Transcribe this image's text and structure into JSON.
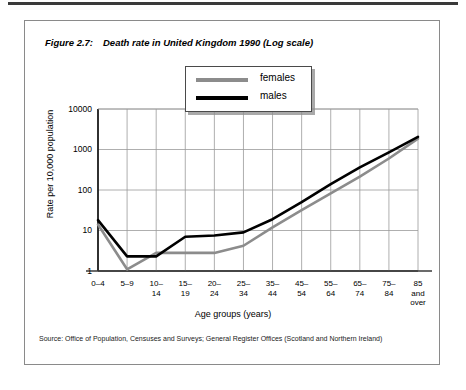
{
  "figure": {
    "number": "Figure 2.7:",
    "title": "Death rate in United Kingdom 1990 (Log scale)",
    "source": "Source: Office of Population, Censuses and Surveys; General Register Offices (Scotland and Northern Ireland)"
  },
  "legend": {
    "items": [
      {
        "label": "females",
        "color": "#8c8c8c"
      },
      {
        "label": "males",
        "color": "#000000"
      }
    ]
  },
  "chart_data": {
    "type": "line",
    "title": "Death rate in United Kingdom 1990 (Log scale)",
    "xlabel": "Age groups (years)",
    "ylabel": "Rate per 10,000  population",
    "yscale": "log",
    "ylim": [
      1,
      10000
    ],
    "yticks": [
      "1",
      "10",
      "100",
      "1000",
      "10000"
    ],
    "grid": true,
    "legend_position": "top-center",
    "categories": [
      "0–4",
      "5–9",
      "10–14",
      "15–19",
      "20–24",
      "25–34",
      "35–44",
      "45–54",
      "55–64",
      "65–74",
      "75–84",
      "85 and over"
    ],
    "categories_display": [
      [
        "0–4"
      ],
      [
        "5–9"
      ],
      [
        "10–",
        "14"
      ],
      [
        "15–",
        "19"
      ],
      [
        "20–",
        "24"
      ],
      [
        "25–",
        "34"
      ],
      [
        "35–",
        "44"
      ],
      [
        "45–",
        "54"
      ],
      [
        "55–",
        "64"
      ],
      [
        "65–",
        "74"
      ],
      [
        "75–",
        "84"
      ],
      [
        "85",
        "and",
        "over"
      ]
    ],
    "series": [
      {
        "name": "males",
        "color": "#000000",
        "values": [
          18,
          2.3,
          2.3,
          7,
          7.5,
          9,
          19,
          50,
          140,
          360,
          850,
          2050
        ]
      },
      {
        "name": "females",
        "color": "#8c8c8c",
        "values": [
          14,
          1.1,
          2.8,
          2.8,
          2.8,
          4.2,
          12,
          32,
          82,
          215,
          600,
          1850
        ]
      }
    ]
  }
}
